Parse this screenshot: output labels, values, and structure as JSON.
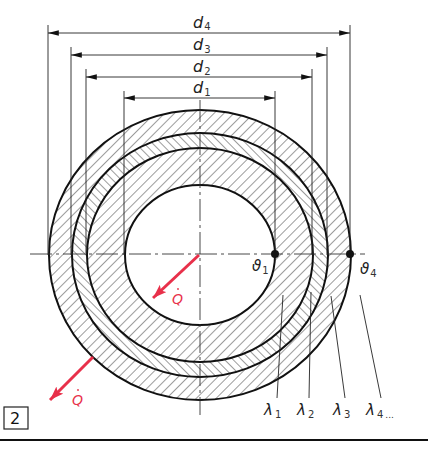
{
  "figure": {
    "number": "2",
    "center": {
      "x": 200,
      "y": 255
    },
    "rings": [
      {
        "name": "layer-1",
        "rx_inner": 75,
        "ry_inner": 70,
        "rx_outer": 113,
        "ry_outer": 107,
        "hatch": "forward",
        "conductivity": "λ1"
      },
      {
        "name": "layer-2",
        "rx_inner": 113,
        "ry_inner": 107,
        "rx_outer": 128,
        "ry_outer": 122,
        "hatch": "backward",
        "conductivity": "λ2"
      },
      {
        "name": "layer-3",
        "rx_inner": 128,
        "ry_inner": 122,
        "rx_outer": 151,
        "ry_outer": 145,
        "hatch": "forward",
        "conductivity": "λ3"
      }
    ],
    "dimensions": [
      {
        "label": "d",
        "sub": "4",
        "y": 33,
        "x1": 48,
        "x2": 350
      },
      {
        "label": "d",
        "sub": "3",
        "y": 55,
        "x1": 71,
        "x2": 327
      },
      {
        "label": "d",
        "sub": "2",
        "y": 77,
        "x1": 86,
        "x2": 312
      },
      {
        "label": "d",
        "sub": "1",
        "y": 98,
        "x1": 124,
        "x2": 275
      }
    ],
    "temperatures": [
      {
        "label": "ϑ",
        "sub": "1"
      },
      {
        "label": "ϑ",
        "sub": "4"
      }
    ],
    "conductivities": [
      {
        "label": "λ",
        "sub": "1"
      },
      {
        "label": "λ",
        "sub": "2"
      },
      {
        "label": "λ",
        "sub": "3"
      },
      {
        "label": "λ",
        "sub": "4",
        "suffix": "..."
      }
    ],
    "heat_flow": {
      "label": "Q",
      "accent": "•",
      "color": "#e8304a"
    }
  }
}
